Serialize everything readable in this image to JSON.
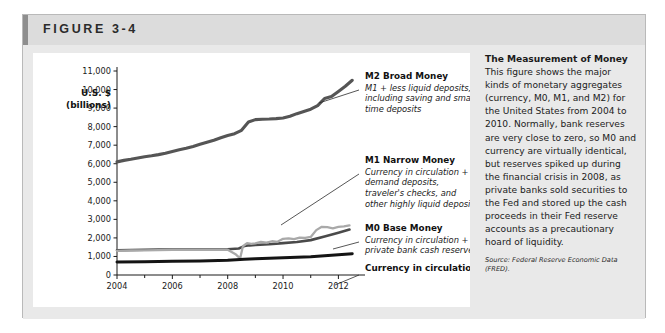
{
  "figure": {
    "label": "FIGURE 3-4"
  },
  "chart": {
    "y_axis_title_line1": "U.S. $",
    "y_axis_title_line2": "(billions)",
    "y_ticks": [
      "11,000",
      "10,000",
      "9,000",
      "8,000",
      "7,000",
      "6,000",
      "5,000",
      "4,000",
      "3,000",
      "2,000",
      "1,000",
      "0"
    ],
    "x_ticks": [
      "2004",
      "2006",
      "2008",
      "2010",
      "2012"
    ]
  },
  "callouts": [
    {
      "name": "m2",
      "title": "M2 Broad Money",
      "desc_lines": [
        "M1 + less liquid deposits,",
        "including saving and small",
        "time deposits"
      ]
    },
    {
      "name": "m1",
      "title": "M1 Narrow Money",
      "desc_lines": [
        "Currency in circulation +",
        "demand deposits,",
        "traveler's checks, and",
        "other highly liquid deposits"
      ]
    },
    {
      "name": "m0",
      "title": "M0 Base Money",
      "desc_lines": [
        "Currency in circulation +",
        "private bank cash reserves"
      ]
    },
    {
      "name": "currency",
      "title": "Currency in circulation",
      "desc_lines": []
    }
  ],
  "caption": {
    "title": "The Measurement of Money",
    "body": " This figure shows the major kinds of monetary aggregates (currency, M0, M1, and M2) for the United States from 2004 to 2010. Normally, bank reserves are very close to zero, so M0 and currency are virtually identical, but reserves spiked up during the financial crisis in 2008, as private banks sold securities to the Fed and stored up the cash proceeds in their Fed reserve accounts as a precautionary hoard of liquidity.",
    "source": "Source: Federal Reserve Economic Data (FRED)."
  },
  "colors": {
    "m2": "#555555",
    "m1": "#4a4a4a",
    "m0": "#a9a9a9",
    "currency": "#141414",
    "header_band": "#dcdcdc",
    "panel_bg": "#e9e9e9",
    "axis": "#1a1a1a"
  },
  "chart_data": {
    "type": "line",
    "title": "The Measurement of Money",
    "xlabel": "",
    "ylabel": "U.S. $ (billions)",
    "xlim": [
      2004,
      2012.6
    ],
    "ylim": [
      0,
      11000
    ],
    "xticks": [
      2004,
      2006,
      2008,
      2010,
      2012
    ],
    "yticks": [
      0,
      1000,
      2000,
      3000,
      4000,
      5000,
      6000,
      7000,
      8000,
      9000,
      10000,
      11000
    ],
    "grid": false,
    "legend": "callout-labels",
    "series": [
      {
        "name": "M2 Broad Money",
        "color": "#555555",
        "x": [
          2004.0,
          2004.25,
          2004.5,
          2004.75,
          2005.0,
          2005.25,
          2005.5,
          2005.75,
          2006.0,
          2006.25,
          2006.5,
          2006.75,
          2007.0,
          2007.25,
          2007.5,
          2007.75,
          2008.0,
          2008.25,
          2008.5,
          2008.75,
          2009.0,
          2009.25,
          2009.5,
          2009.75,
          2010.0,
          2010.25,
          2010.5,
          2010.75,
          2011.0,
          2011.25,
          2011.5,
          2011.75,
          2012.0,
          2012.25,
          2012.5
        ],
        "values": [
          6100,
          6180,
          6240,
          6310,
          6380,
          6430,
          6490,
          6560,
          6660,
          6750,
          6830,
          6930,
          7050,
          7160,
          7270,
          7400,
          7520,
          7620,
          7800,
          8250,
          8380,
          8400,
          8410,
          8430,
          8470,
          8560,
          8700,
          8820,
          8940,
          9130,
          9520,
          9620,
          9900,
          10180,
          10500
        ]
      },
      {
        "name": "M1 Narrow Money",
        "color": "#4a4a4a",
        "x": [
          2004.0,
          2004.5,
          2005.0,
          2005.5,
          2006.0,
          2006.5,
          2007.0,
          2007.5,
          2008.0,
          2008.4,
          2008.6,
          2008.8,
          2009.0,
          2009.5,
          2010.0,
          2010.5,
          2011.0,
          2011.5,
          2012.0,
          2012.4
        ],
        "values": [
          1330,
          1350,
          1360,
          1370,
          1370,
          1370,
          1370,
          1370,
          1390,
          1430,
          1560,
          1600,
          1620,
          1660,
          1720,
          1780,
          1880,
          2080,
          2280,
          2450
        ]
      },
      {
        "name": "M0 Base Money",
        "color": "#a9a9a9",
        "x": [
          2004.0,
          2004.5,
          2005.0,
          2005.5,
          2006.0,
          2006.5,
          2007.0,
          2007.5,
          2008.0,
          2008.3,
          2008.45,
          2008.55,
          2008.7,
          2008.85,
          2009.0,
          2009.2,
          2009.4,
          2009.6,
          2009.8,
          2010.0,
          2010.2,
          2010.4,
          2010.6,
          2010.8,
          2011.0,
          2011.2,
          2011.4,
          2011.6,
          2011.8,
          2012.0,
          2012.2,
          2012.4
        ],
        "values": [
          1300,
          1320,
          1330,
          1340,
          1350,
          1350,
          1350,
          1350,
          1360,
          1100,
          900,
          1550,
          1720,
          1680,
          1710,
          1780,
          1740,
          1820,
          1790,
          1950,
          1980,
          1930,
          2010,
          2000,
          2050,
          2420,
          2600,
          2580,
          2520,
          2590,
          2620,
          2680
        ]
      },
      {
        "name": "Currency in circulation",
        "color": "#141414",
        "x": [
          2004.0,
          2005.0,
          2006.0,
          2007.0,
          2008.0,
          2008.6,
          2009.0,
          2010.0,
          2011.0,
          2012.0,
          2012.5
        ],
        "values": [
          700,
          720,
          740,
          760,
          790,
          850,
          880,
          930,
          990,
          1090,
          1150
        ]
      }
    ]
  }
}
